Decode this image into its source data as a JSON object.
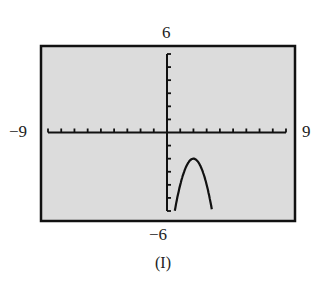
{
  "chart_data": {
    "type": "line",
    "title": "",
    "caption": "(I)",
    "xlabel": "",
    "ylabel": "",
    "xlim": [
      -9,
      9
    ],
    "ylim": [
      -6,
      6
    ],
    "window_labels": {
      "ymax": "6",
      "ymin": "−6",
      "xmin": "−9",
      "xmax": "9"
    },
    "x_tick_step": 1,
    "y_tick_step": 1,
    "grid": false,
    "background": "#dcdcdc",
    "series": [
      {
        "name": "parabola",
        "description": "downward-opening parabola, vertex near (2, -2), crossing bottom of window near x=0.6 and x=3.4",
        "x": [
          0.59,
          1.0,
          1.5,
          2.0,
          2.5,
          3.0,
          3.41
        ],
        "y": [
          -6.0,
          -4.0,
          -2.5,
          -2.0,
          -2.5,
          -4.0,
          -6.0
        ]
      }
    ]
  }
}
